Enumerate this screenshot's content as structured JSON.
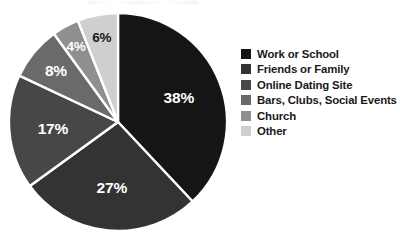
{
  "chart_data": {
    "type": "pie",
    "title": "",
    "xlabel": "",
    "ylabel": "",
    "grid": false,
    "legend_position": "right",
    "start_angle_deg": 0,
    "direction": "clockwise",
    "units": "percent",
    "total": 100,
    "categories": [
      "Work or School",
      "Friends or Family",
      "Online Dating Site",
      "Bars, Clubs, Social Events",
      "Church",
      "Other"
    ],
    "values": [
      38,
      27,
      17,
      8,
      4,
      6
    ],
    "data_labels": [
      "38%",
      "27%",
      "17%",
      "8%",
      "4%",
      "6%"
    ],
    "slice_colors": [
      "#151515",
      "#333333",
      "#474747",
      "#6a6a6a",
      "#8f8f8f",
      "#cfcfcf"
    ],
    "label_text_colors": [
      "#ffffff",
      "#ffffff",
      "#ffffff",
      "#ffffff",
      "#ffffff",
      "#1a1a1a"
    ],
    "separator_color": "#ffffff",
    "slices": [
      {
        "label": "Work or School",
        "value": 38,
        "data_label": "38%",
        "color": "#151515"
      },
      {
        "label": "Friends or Family",
        "value": 27,
        "data_label": "27%",
        "color": "#333333"
      },
      {
        "label": "Online Dating Site",
        "value": 17,
        "data_label": "17%",
        "color": "#474747"
      },
      {
        "label": "Bars, Clubs, Social Events",
        "value": 8,
        "data_label": "8%",
        "color": "#6a6a6a"
      },
      {
        "label": "Church",
        "value": 4,
        "data_label": "4%",
        "color": "#8f8f8f"
      },
      {
        "label": "Other",
        "value": 6,
        "data_label": "6%",
        "color": "#cfcfcf"
      }
    ]
  },
  "legend": {
    "items": [
      {
        "label": "Work or School",
        "color": "#151515"
      },
      {
        "label": "Friends or Family",
        "color": "#333333"
      },
      {
        "label": "Online Dating Site",
        "color": "#474747"
      },
      {
        "label": "Bars, Clubs, Social Events",
        "color": "#6a6a6a"
      },
      {
        "label": "Church",
        "color": "#8f8f8f"
      },
      {
        "label": "Other",
        "color": "#cfcfcf"
      }
    ]
  },
  "labels": {
    "slice_1": "38%",
    "slice_2": "27%",
    "slice_3": "17%",
    "slice_4": "8%",
    "slice_5": "4%",
    "slice_6": "6%"
  }
}
